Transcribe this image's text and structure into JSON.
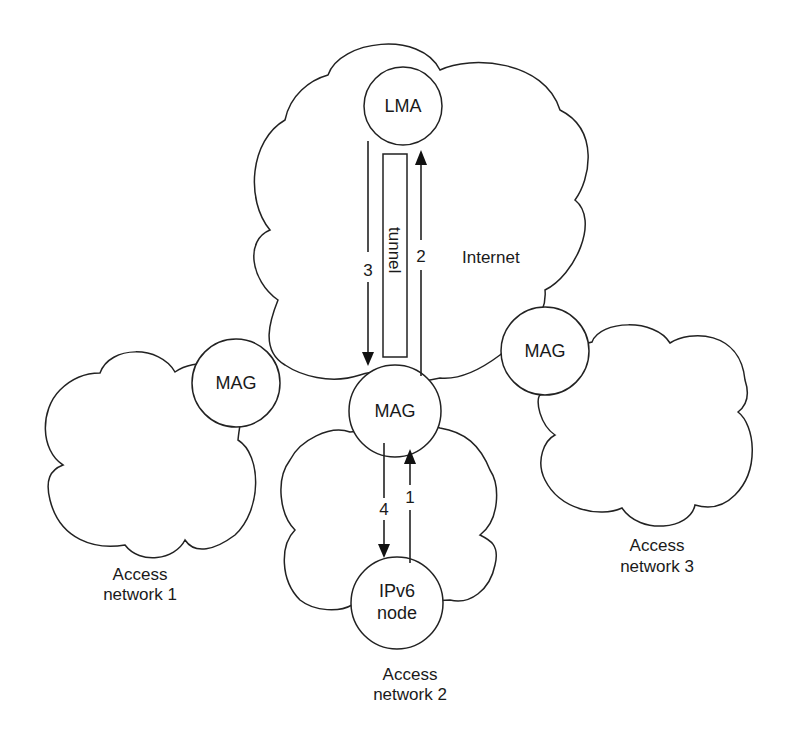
{
  "diagram": {
    "clouds": [
      {
        "id": "internet",
        "label": "Internet"
      },
      {
        "id": "access1",
        "label_line1": "Access",
        "label_line2": "network 1"
      },
      {
        "id": "access2",
        "label_line1": "Access",
        "label_line2": "network 2"
      },
      {
        "id": "access3",
        "label_line1": "Access",
        "label_line2": "network 3"
      }
    ],
    "nodes": {
      "lma": {
        "label": "LMA"
      },
      "mag1": {
        "label": "MAG"
      },
      "mag2": {
        "label": "MAG"
      },
      "mag3": {
        "label": "MAG"
      },
      "ipv6": {
        "label_line1": "IPv6",
        "label_line2": "node"
      }
    },
    "tunnel": {
      "label": "tunnel"
    },
    "arrows": [
      {
        "step": "1",
        "from": "IPv6 node",
        "to": "MAG"
      },
      {
        "step": "2",
        "from": "MAG",
        "to": "LMA"
      },
      {
        "step": "3",
        "from": "LMA",
        "to": "MAG"
      },
      {
        "step": "4",
        "from": "MAG",
        "to": "IPv6 node"
      }
    ],
    "colors": {
      "stroke": "#222222",
      "background": "#ffffff"
    }
  }
}
